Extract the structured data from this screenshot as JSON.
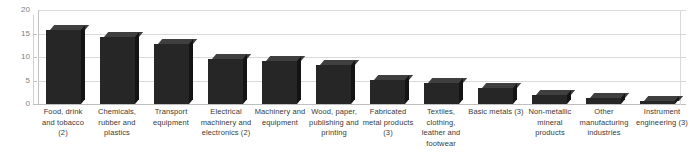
{
  "chart_data": {
    "type": "bar",
    "title": "",
    "subtitle": "",
    "xlabel": "",
    "ylabel": "",
    "ylim": [
      0,
      20
    ],
    "yticks": [
      0,
      5,
      10,
      15,
      20
    ],
    "grid": true,
    "legend": false,
    "style": "3d-column",
    "bar_color": "#262626",
    "bar_top_color": "#3f3f3f",
    "bar_side_color": "#141414",
    "gridline_color": "#d9d9d9",
    "axis_color": "#bfbfbf",
    "tick_label_color": "#7f7f7f",
    "category_label_color": "#3a3a3a",
    "categories": [
      "Food, drink and tobacco (2)",
      "Chemicals, rubber and plastics",
      "Transport equipment",
      "Electrical machinery and electronics (2)",
      "Machinery and equipment",
      "Wood, paper, publishing and printing",
      "Fabricated metal products (3)",
      "Textiles, clothing, leather and footwear",
      "Basic metals (3)",
      "Non-metallic mineral products",
      "Other manufacturing industries",
      "Instrument engineering (3)"
    ],
    "values": [
      15.7,
      14.3,
      12.8,
      9.6,
      9.2,
      8.3,
      5.1,
      4.5,
      3.4,
      1.9,
      1.3,
      0.7
    ]
  },
  "axis": {
    "tick_0": "0",
    "tick_5": "5",
    "tick_10": "10",
    "tick_15": "15",
    "tick_20": "20"
  },
  "labels": {
    "cat_0_line_0": "Food, drink",
    "cat_0_line_1": "and tobacco",
    "cat_0_line_2": "(2)",
    "cat_1_line_0": "Chemicals,",
    "cat_1_line_1": "rubber and",
    "cat_1_line_2": "plastics",
    "cat_2_line_0": "Transport",
    "cat_2_line_1": "equipment",
    "cat_3_line_0": "Electrical",
    "cat_3_line_1": "machinery and",
    "cat_3_line_2": "electronics (2)",
    "cat_4_line_0": "Machinery and",
    "cat_4_line_1": "equipment",
    "cat_5_line_0": "Wood, paper,",
    "cat_5_line_1": "publishing and",
    "cat_5_line_2": "printing",
    "cat_6_line_0": "Fabricated",
    "cat_6_line_1": "metal products",
    "cat_6_line_2": "(3)",
    "cat_7_line_0": "Textiles,",
    "cat_7_line_1": "clothing,",
    "cat_7_line_2": "leather and",
    "cat_7_line_3": "footwear",
    "cat_8_line_0": "Basic metals (3)",
    "cat_9_line_0": "Non-metallic",
    "cat_9_line_1": "mineral",
    "cat_9_line_2": "products",
    "cat_10_line_0": "Other",
    "cat_10_line_1": "manufacturing",
    "cat_10_line_2": "industries",
    "cat_11_line_0": "Instrument",
    "cat_11_line_1": "engineering (3)"
  }
}
